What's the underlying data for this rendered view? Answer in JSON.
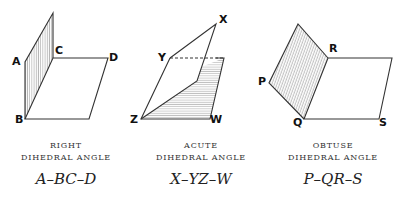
{
  "figures": [
    {
      "caption_line1": "RIGHT",
      "caption_line2": "DIHEDRAL ANGLE",
      "name": "A–BC–D",
      "points": {
        "A": "A",
        "B": "B",
        "C": "C",
        "D": "D"
      }
    },
    {
      "caption_line1": "ACUTE",
      "caption_line2": "DIHEDRAL ANGLE",
      "name": "X–YZ–W",
      "points": {
        "X": "X",
        "Y": "Y",
        "Z": "Z",
        "W": "W"
      }
    },
    {
      "caption_line1": "OBTUSE",
      "caption_line2": "DIHEDRAL ANGLE",
      "name": "P–QR–S",
      "points": {
        "P": "P",
        "Q": "Q",
        "R": "R",
        "S": "S"
      }
    }
  ],
  "colors": {
    "stroke": "#333333",
    "hatch": "#777777",
    "text": "#111111"
  }
}
